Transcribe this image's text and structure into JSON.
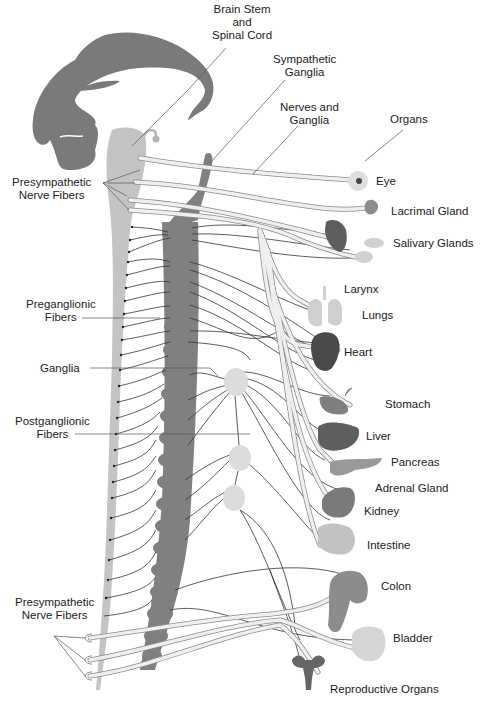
{
  "diagram": {
    "colors": {
      "brain": "#7a7a7a",
      "spinal_cord": "#c4c4c4",
      "sympathetic_chain": "#808080",
      "nerve_fill": "#efefef",
      "nerve_stroke": "#8a8a8a",
      "ganglion": "#dcdcdc",
      "organ_dark": "#5e5e5e",
      "organ_mid": "#8c8c8c",
      "organ_light": "#c8c8c8",
      "leader": "#555555"
    },
    "top_labels": {
      "brain_stem": [
        "Brain Stem",
        "and",
        "Spinal Cord"
      ],
      "sympathetic_ganglia": [
        "Sympathetic",
        "Ganglia"
      ],
      "nerves_and_ganglia": [
        "Nerves and",
        "Ganglia"
      ],
      "organs": "Organs"
    },
    "left_labels": {
      "presympathetic_top": [
        "Presympathetic",
        "Nerve Fibers"
      ],
      "preganglionic": [
        "Preganglionic",
        "Fibers"
      ],
      "ganglia": "Ganglia",
      "postganglionic": [
        "Postganglionic",
        "Fibers"
      ],
      "presympathetic_bottom": [
        "Presympathetic",
        "Nerve Fibers"
      ]
    },
    "organs": [
      {
        "name": "Eye",
        "x": 376,
        "y": 177
      },
      {
        "name": "Lacrimal Gland",
        "x": 391,
        "y": 205
      },
      {
        "name": "Salivary Glands",
        "x": 393,
        "y": 237
      },
      {
        "name": "Larynx",
        "x": 344,
        "y": 284
      },
      {
        "name": "Lungs",
        "x": 362,
        "y": 310
      },
      {
        "name": "Heart",
        "x": 344,
        "y": 347
      },
      {
        "name": "Stomach",
        "x": 385,
        "y": 399
      },
      {
        "name": "Liver",
        "x": 366,
        "y": 431
      },
      {
        "name": "Pancreas",
        "x": 391,
        "y": 457
      },
      {
        "name": "Adrenal Gland",
        "x": 375,
        "y": 483
      },
      {
        "name": "Kidney",
        "x": 364,
        "y": 506
      },
      {
        "name": "Intestine",
        "x": 367,
        "y": 540
      },
      {
        "name": "Colon",
        "x": 381,
        "y": 581
      },
      {
        "name": "Bladder",
        "x": 393,
        "y": 632
      },
      {
        "name": "Reproductive Organs",
        "x": 330,
        "y": 683
      }
    ]
  }
}
